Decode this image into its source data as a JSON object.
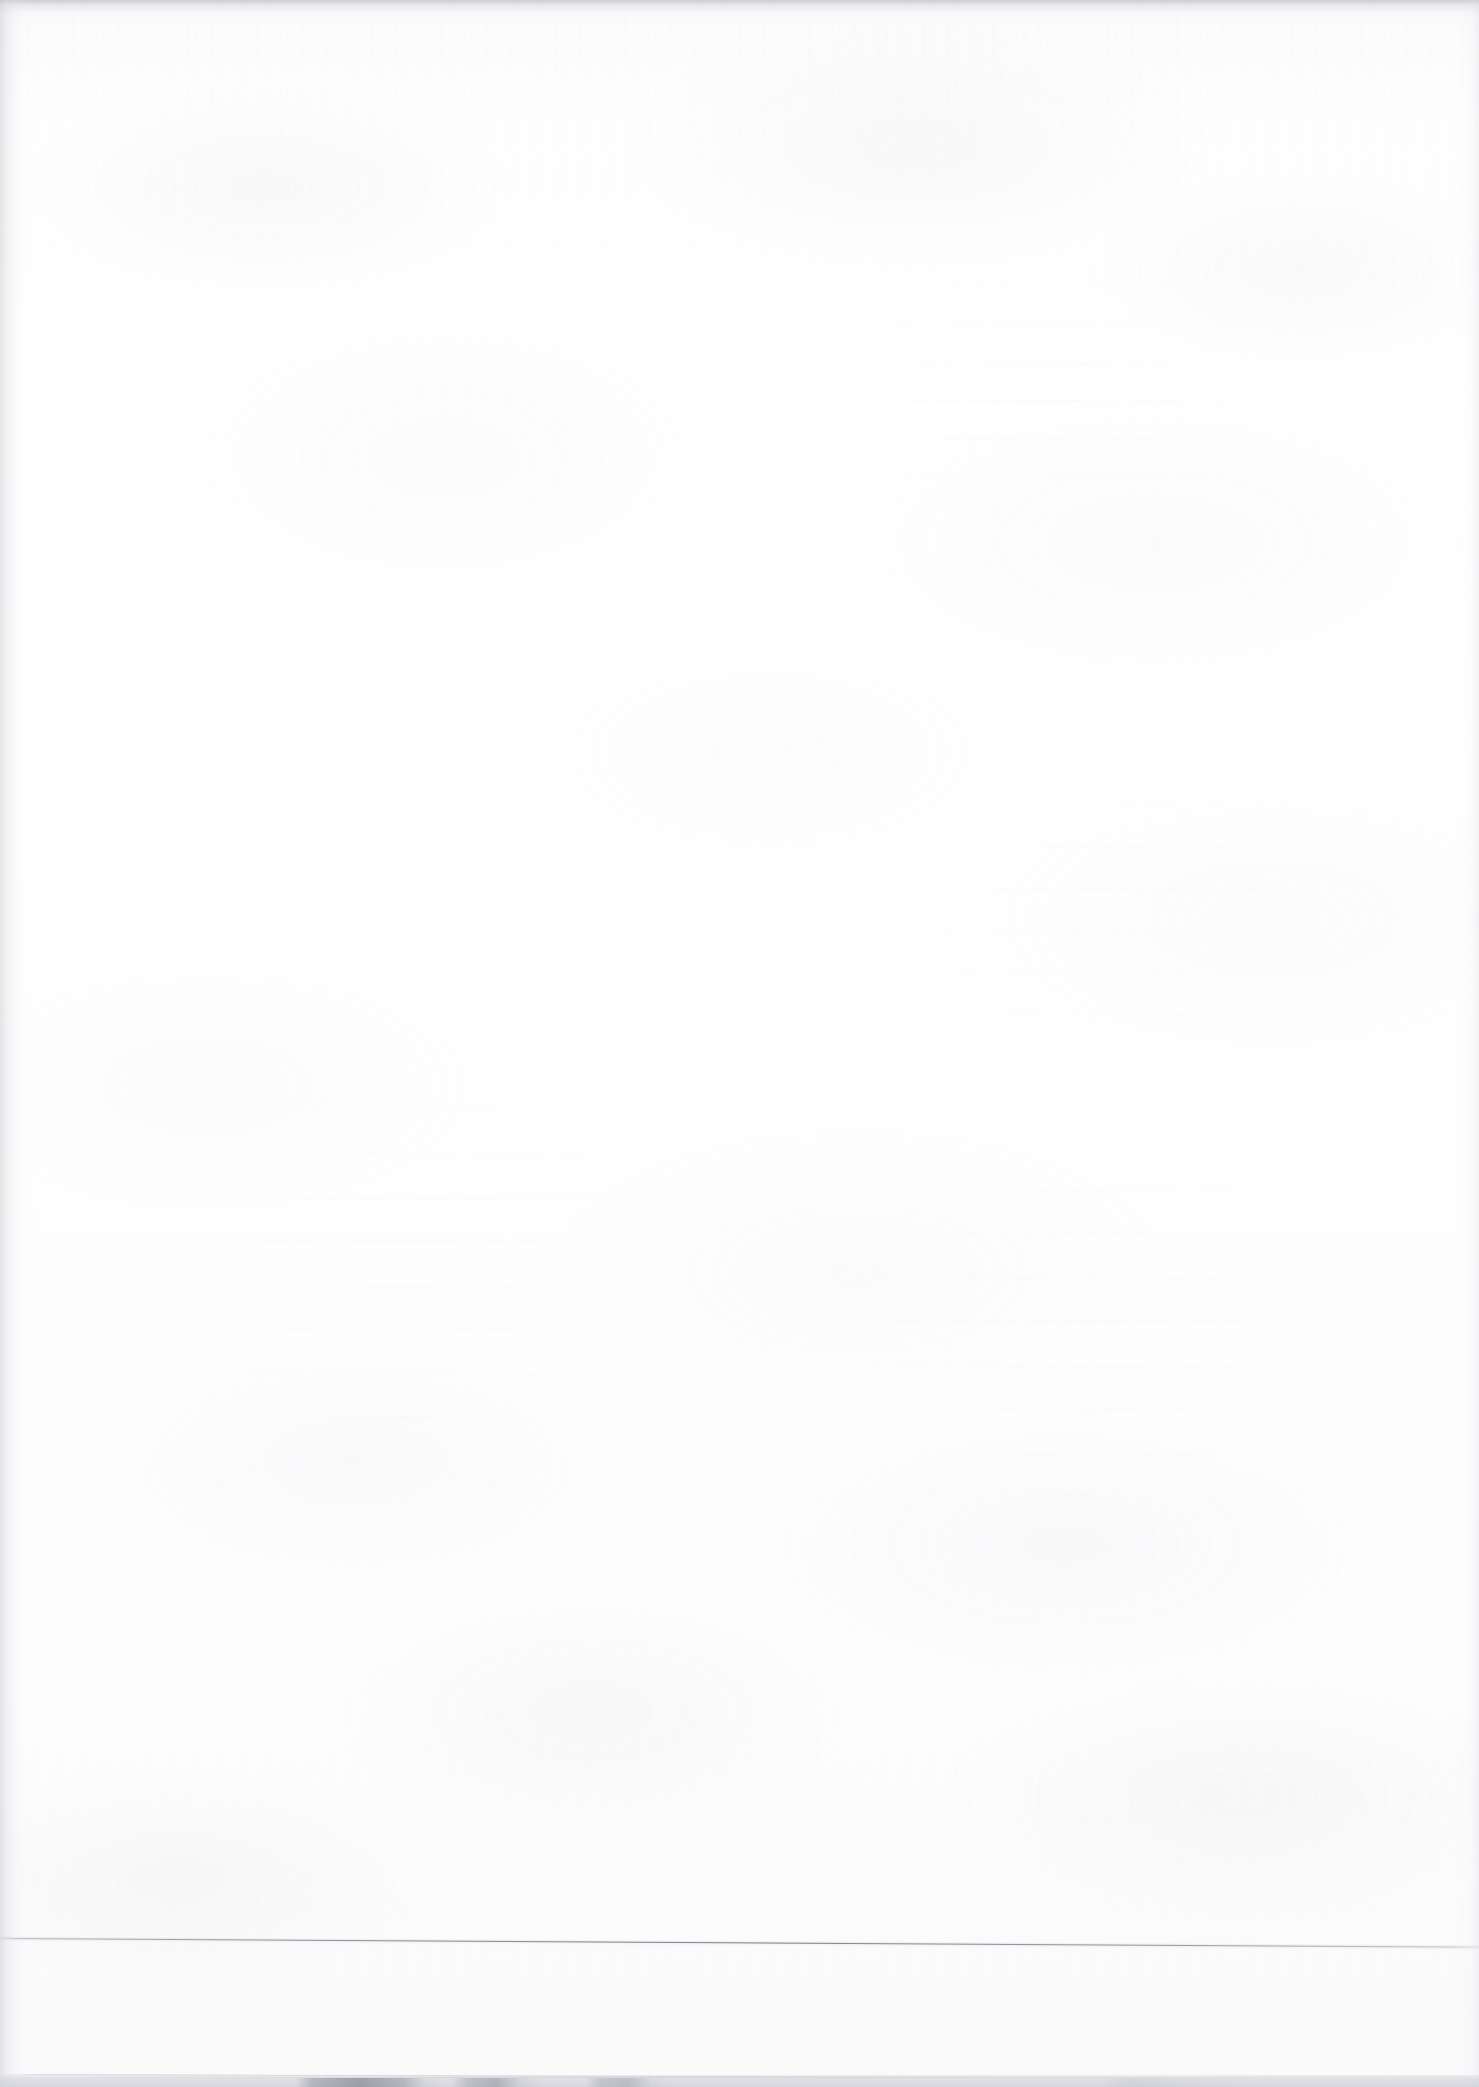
{
  "document": {
    "kind": "scanned-page",
    "page_content": "",
    "visible_text": "",
    "description": "Blank scanned document page. No printed or handwritten text is legible anywhere in the image.",
    "width_px": 1479,
    "height_px": 2087
  },
  "appearance": {
    "paper_color": "#fdfdfd",
    "paper_tint_top": "#f4f4f5",
    "paper_tint_bottom": "#fafafb",
    "gutter_shadow_color": "#c6c6ce",
    "top_edge_shadow_color": "#b2b2ba",
    "rule_color": "#70708 0",
    "platen_shadow_color": "#86869 4"
  },
  "features": {
    "sheet_bottom_rule": {
      "name": "sheet-bottom-edge-rule",
      "orientation": "horizontal",
      "slant": "slightly descending left-to-right",
      "y_left_px": 1938,
      "y_right_px": 1947,
      "thickness_px": 1
    },
    "lower_rule": {
      "name": "lower-faint-rule",
      "orientation": "horizontal",
      "y_px": 2074,
      "thickness_px": 1
    },
    "left_gutter": {
      "name": "left-gutter-shadow",
      "x_px": 0,
      "width_px": 34
    },
    "top_edge": {
      "name": "top-edge-shadow",
      "y_px": 0,
      "height_px": 26
    },
    "right_edge": {
      "name": "right-edge-shadow",
      "width_px": 22
    },
    "platen_shadow": {
      "name": "scanner-platen-shadow",
      "y_px": 2078,
      "height_px": 9,
      "dark_block_ranges_px": [
        [
          312,
          424
        ],
        [
          468,
          520
        ],
        [
          600,
          652
        ]
      ]
    },
    "bleed_through": [
      {
        "name": "ghost-upper-right",
        "x_px": 720,
        "y_px": 230,
        "width_px": 560,
        "height_px": 360,
        "legible": false
      },
      {
        "name": "ghost-mid-right",
        "x_px": 820,
        "y_px": 700,
        "width_px": 540,
        "height_px": 430,
        "legible": false
      },
      {
        "name": "ghost-lower-left",
        "x_px": 70,
        "y_px": 1000,
        "width_px": 720,
        "height_px": 520,
        "legible": false
      },
      {
        "name": "ghost-lower-right",
        "x_px": 760,
        "y_px": 1080,
        "width_px": 680,
        "height_px": 500,
        "legible": false
      }
    ]
  }
}
